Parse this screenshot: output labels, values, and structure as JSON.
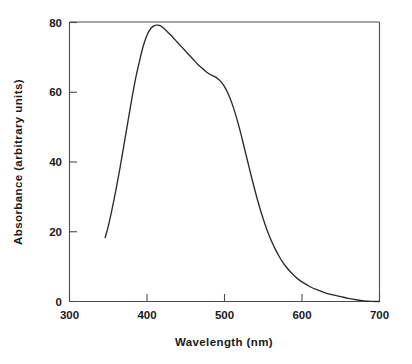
{
  "chart_data": {
    "type": "line",
    "title": "",
    "xlabel": "Wavelength (nm)",
    "ylabel": "Absorbance (arbitrary units)",
    "xlim": [
      300,
      700
    ],
    "ylim": [
      0,
      80
    ],
    "xticks": [
      300,
      400,
      500,
      600,
      700
    ],
    "yticks": [
      0,
      20,
      40,
      60,
      80
    ],
    "xtick_labels": [
      "300",
      "400",
      "500",
      "600",
      "700"
    ],
    "ytick_labels": [
      "0",
      "20",
      "40",
      "60",
      "80"
    ],
    "grid": false,
    "legend": "none",
    "series": [
      {
        "name": "absorbance",
        "color": "#2b2b2b",
        "x": [
          346,
          350,
          355,
          360,
          365,
          370,
          375,
          380,
          385,
          390,
          395,
          400,
          405,
          410,
          413,
          416,
          420,
          425,
          430,
          435,
          440,
          445,
          450,
          455,
          460,
          465,
          470,
          475,
          480,
          485,
          490,
          495,
          500,
          505,
          510,
          515,
          520,
          525,
          530,
          535,
          540,
          545,
          550,
          555,
          560,
          565,
          570,
          575,
          580,
          585,
          590,
          595,
          600,
          610,
          620,
          630,
          640,
          650,
          660,
          670,
          680,
          690,
          700
        ],
        "y": [
          18.3,
          21.5,
          26.5,
          32.0,
          38.0,
          44.5,
          51.0,
          57.5,
          63.5,
          68.5,
          73.0,
          76.2,
          78.2,
          79.0,
          79.1,
          79.0,
          78.5,
          77.5,
          76.4,
          75.2,
          74.0,
          72.8,
          71.6,
          70.4,
          69.2,
          68.0,
          67.0,
          66.0,
          65.2,
          64.6,
          64.0,
          63.0,
          61.5,
          59.3,
          56.5,
          53.0,
          49.0,
          44.5,
          40.0,
          35.5,
          31.2,
          27.2,
          23.6,
          20.4,
          17.6,
          15.2,
          13.1,
          11.3,
          9.8,
          8.5,
          7.4,
          6.4,
          5.6,
          4.3,
          3.3,
          2.5,
          1.9,
          1.4,
          0.9,
          0.5,
          0.2,
          0.05,
          0.0
        ]
      }
    ],
    "annotations": {
      "peak_wavelength": 413,
      "peak_absorbance": 79,
      "curve_start_wavelength": 346,
      "curve_start_absorbance": 18,
      "shoulder_wavelength": 490,
      "shoulder_absorbance": 64
    }
  },
  "axes": {
    "x_title": "Wavelength (nm)",
    "y_title": "Absorbance (arbitrary units)"
  },
  "colors": {
    "background": "#ffffff",
    "curve": "#2b2b2b",
    "axis": "#4d4d4d",
    "text": "#1a1a1a"
  }
}
